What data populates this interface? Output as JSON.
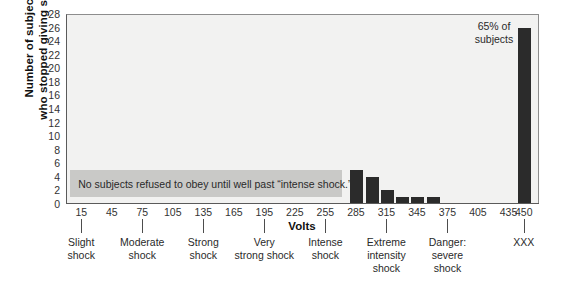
{
  "chart_data": {
    "type": "bar",
    "title": "",
    "subtitle": "",
    "xlabel": "Volts",
    "ylabel_lines": [
      "Number of subjects",
      "who stopped giving shocks"
    ],
    "ylabel": "Number of subjects who stopped giving shocks",
    "ylim": [
      0,
      28
    ],
    "ytick_step": 2,
    "yticks": [
      0,
      2,
      4,
      6,
      8,
      10,
      12,
      14,
      16,
      18,
      20,
      22,
      24,
      26,
      28
    ],
    "xticks": [
      15,
      45,
      75,
      105,
      135,
      165,
      195,
      225,
      255,
      285,
      315,
      345,
      375,
      405,
      435,
      450
    ],
    "xtick_labels": [
      "15",
      "45",
      "75",
      "105",
      "135",
      "165",
      "195",
      "225",
      "255",
      "285",
      "315",
      "345",
      "375",
      "405",
      "435",
      "450"
    ],
    "grid": false,
    "legend": null,
    "bar_color": "#2b2b2b",
    "plot_background": "#f2f2f1",
    "categories": [
      15,
      45,
      75,
      105,
      135,
      165,
      195,
      225,
      255,
      285,
      315,
      345,
      375,
      405,
      435,
      450
    ],
    "values": [
      0,
      0,
      0,
      0,
      0,
      0,
      0,
      0,
      0,
      5,
      4,
      2,
      1,
      0,
      0,
      26
    ],
    "bars": [
      {
        "volts": 285,
        "value": 5
      },
      {
        "volts": 300,
        "value": 4
      },
      {
        "volts": 315,
        "value": 2
      },
      {
        "volts": 330,
        "value": 1
      },
      {
        "volts": 345,
        "value": 1
      },
      {
        "volts": 360,
        "value": 1
      },
      {
        "volts": 450,
        "value": 26
      }
    ],
    "annotations": [
      {
        "name": "no-subjects-refused-note",
        "text": "No subjects refused to obey until well past “intense shock.”",
        "x_start_volts": 15,
        "x_end_volts": 270,
        "y_start": 1,
        "y_end": 5,
        "background": "#c9c9c7"
      },
      {
        "name": "sixty-five-percent-callout",
        "lines": [
          "65% of",
          "subjects"
        ],
        "text": "65% of subjects",
        "near_volts": 450
      }
    ],
    "category_bands": [
      {
        "label_lines": [
          "Slight",
          "shock"
        ],
        "tick_volts": 15
      },
      {
        "label_lines": [
          "Moderate",
          "shock"
        ],
        "tick_volts": 75
      },
      {
        "label_lines": [
          "Strong",
          "shock"
        ],
        "tick_volts": 135
      },
      {
        "label_lines": [
          "Very",
          "strong shock"
        ],
        "tick_volts": 195
      },
      {
        "label_lines": [
          "Intense",
          "shock"
        ],
        "tick_volts": 255
      },
      {
        "label_lines": [
          "Extreme",
          "intensity",
          "shock"
        ],
        "tick_volts": 315
      },
      {
        "label_lines": [
          "Danger:",
          "severe",
          "shock"
        ],
        "tick_volts": 375
      },
      {
        "label_lines": [
          "XXX"
        ],
        "tick_volts": 450
      }
    ]
  }
}
